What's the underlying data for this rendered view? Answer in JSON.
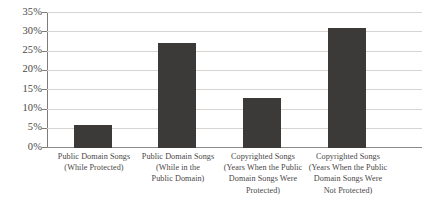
{
  "chart_data": {
    "type": "bar",
    "title": "",
    "subtitle": "",
    "xlabel": "",
    "ylabel": "",
    "ylim": [
      0,
      35
    ],
    "ytick_interval": 5,
    "grid": true,
    "legend": "none",
    "orientation": "vertical",
    "value_format": "percent",
    "categories": [
      "Public Domain Songs (While Protected)",
      "Public Domain Songs (While in the Public Domain)",
      "Copyrighted Songs (Years When the Public Domain Songs Were Protected)",
      "Copyrighted Songs (Years When the Public Domain Songs Were Not Protected)"
    ],
    "category_lines": [
      [
        "Public Domain Songs",
        "(While Protected)"
      ],
      [
        "Public Domain Songs",
        "(While in the",
        "Public Domain)"
      ],
      [
        "Copyrighted Songs",
        "(Years When the Public",
        "Domain Songs Were",
        "Protected)"
      ],
      [
        "Copyrighted Songs",
        "(Years When the Public",
        "Domain Songs Were",
        "Not Protected)"
      ]
    ],
    "values": [
      6,
      27,
      13,
      31
    ],
    "value_labels": [
      "6%",
      "27%",
      "13%",
      "31%"
    ],
    "ytick_labels": [
      "0%",
      "5%",
      "10%",
      "15%",
      "20%",
      "25%",
      "30%",
      "35%"
    ],
    "ytick_values": [
      0,
      5,
      10,
      15,
      20,
      25,
      30,
      35
    ],
    "colors": {
      "bar": "#3b3a38",
      "gridline": "#d6d3d0",
      "axis": "#7e7b78",
      "baseline": "#8d8a87",
      "text": "#4a4746",
      "background": "#ffffff"
    }
  }
}
